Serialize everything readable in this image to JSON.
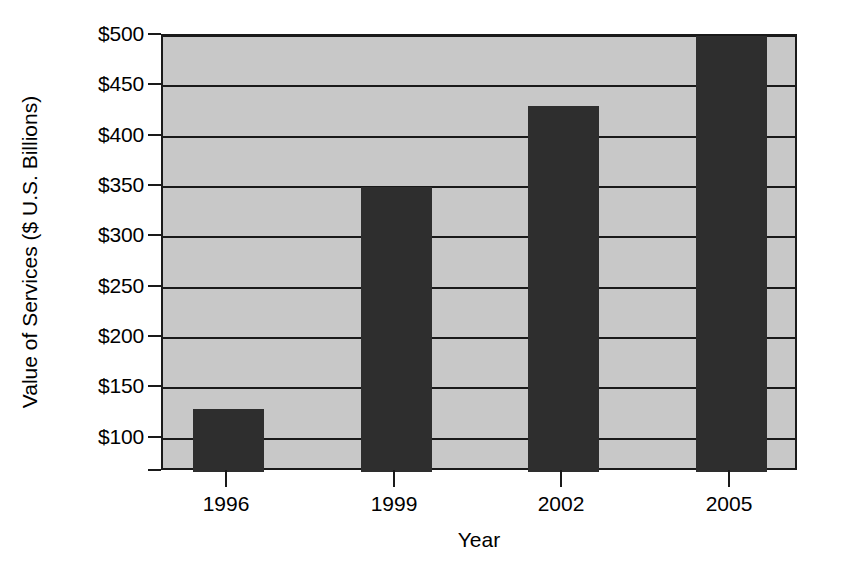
{
  "chart_data": {
    "type": "bar",
    "title": "",
    "categories": [
      "1996",
      "1999",
      "2002",
      "2005"
    ],
    "values": [
      130,
      350,
      430,
      500
    ],
    "series": [
      {
        "name": "Value of Services",
        "values": [
          130,
          350,
          430,
          500
        ]
      }
    ],
    "xlabel": "Year",
    "ylabel": "Value of Services ($ U.S. Billions)",
    "ylim": [
      67,
      500
    ],
    "ytick_values": [
      100,
      150,
      200,
      250,
      300,
      350,
      400,
      450,
      500
    ],
    "ytick_labels": [
      "$100",
      "$150",
      "$200",
      "$250",
      "$300",
      "$350",
      "$400",
      "$450",
      "$500"
    ],
    "xtick_labels": [
      "1996",
      "1999",
      "2002",
      "2005"
    ],
    "grid": true,
    "grid_axis": "y",
    "legend": false,
    "legend_position": "none",
    "bar_color": "#2e2e2e",
    "plot_background_color": "#c8c8c8",
    "figure_background_color": "#ffffff",
    "axis_color": "#1a1a1a",
    "value_prefix": "$",
    "value_unit": "U.S. Billions"
  },
  "axes": {
    "y_title": "Value of Services ($ U.S. Billions)",
    "x_title": "Year"
  },
  "yticks": [
    {
      "label": "$500",
      "value": 500
    },
    {
      "label": "$450",
      "value": 450
    },
    {
      "label": "$400",
      "value": 400
    },
    {
      "label": "$350",
      "value": 350
    },
    {
      "label": "$300",
      "value": 300
    },
    {
      "label": "$250",
      "value": 250
    },
    {
      "label": "$200",
      "value": 200
    },
    {
      "label": "$150",
      "value": 150
    },
    {
      "label": "$100",
      "value": 100
    }
  ],
  "bars": [
    {
      "label": "1996",
      "value": 130
    },
    {
      "label": "1999",
      "value": 350
    },
    {
      "label": "2002",
      "value": 430
    },
    {
      "label": "2005",
      "value": 500
    }
  ]
}
